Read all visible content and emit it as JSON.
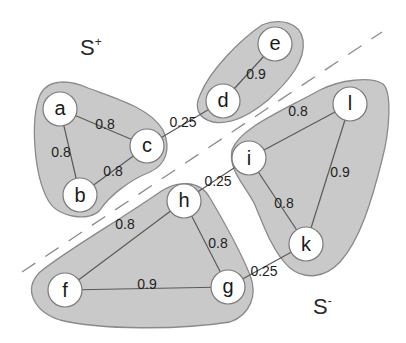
{
  "colors": {
    "background": "#ffffff",
    "cluster_fill": "#c9c9c9",
    "cluster_stroke": "#8a8a8a",
    "node_fill": "#ffffff",
    "node_stroke": "#7a7a7a",
    "edge": "#5a5a5a",
    "dashed_line": "#8c8c8c"
  },
  "set_labels": {
    "positive": {
      "base": "S",
      "sup": "+"
    },
    "negative": {
      "base": "S",
      "sup": "-"
    }
  },
  "nodes": [
    {
      "id": "a",
      "label": "a"
    },
    {
      "id": "b",
      "label": "b"
    },
    {
      "id": "c",
      "label": "c"
    },
    {
      "id": "d",
      "label": "d"
    },
    {
      "id": "e",
      "label": "e"
    },
    {
      "id": "f",
      "label": "f"
    },
    {
      "id": "g",
      "label": "g"
    },
    {
      "id": "h",
      "label": "h"
    },
    {
      "id": "i",
      "label": "i"
    },
    {
      "id": "k",
      "label": "k"
    },
    {
      "id": "l",
      "label": "l"
    }
  ],
  "edges": [
    {
      "from": "a",
      "to": "c",
      "weight": "0.8"
    },
    {
      "from": "a",
      "to": "b",
      "weight": "0.8"
    },
    {
      "from": "b",
      "to": "c",
      "weight": "0.8"
    },
    {
      "from": "c",
      "to": "d",
      "weight": "0.25"
    },
    {
      "from": "d",
      "to": "e",
      "weight": "0.9"
    },
    {
      "from": "i",
      "to": "l",
      "weight": "0.8"
    },
    {
      "from": "l",
      "to": "k",
      "weight": "0.9"
    },
    {
      "from": "i",
      "to": "k",
      "weight": "0.8"
    },
    {
      "from": "h",
      "to": "i",
      "weight": "0.25"
    },
    {
      "from": "h",
      "to": "f",
      "weight": "0.8"
    },
    {
      "from": "h",
      "to": "g",
      "weight": "0.8"
    },
    {
      "from": "f",
      "to": "g",
      "weight": "0.9"
    },
    {
      "from": "g",
      "to": "k",
      "weight": "0.25"
    }
  ],
  "clusters": [
    {
      "id": "abc",
      "members": [
        "a",
        "b",
        "c"
      ]
    },
    {
      "id": "de",
      "members": [
        "d",
        "e"
      ]
    },
    {
      "id": "ilk",
      "members": [
        "i",
        "l",
        "k"
      ]
    },
    {
      "id": "fgh",
      "members": [
        "f",
        "g",
        "h"
      ]
    }
  ]
}
